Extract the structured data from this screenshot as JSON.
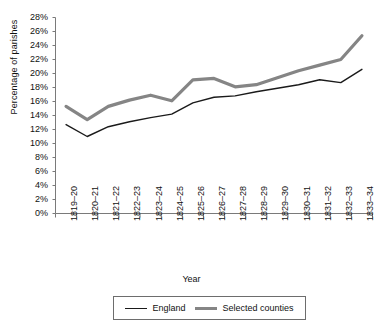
{
  "chart_data": {
    "type": "line",
    "title": "",
    "xlabel": "Year",
    "ylabel": "Percentage of parishes",
    "ylim": [
      0,
      28
    ],
    "ytick_labels": [
      "0%",
      "2%",
      "4%",
      "6%",
      "8%",
      "10%",
      "12%",
      "14%",
      "16%",
      "18%",
      "20%",
      "22%",
      "24%",
      "26%",
      "28%"
    ],
    "ytick_values": [
      0,
      2,
      4,
      6,
      8,
      10,
      12,
      14,
      16,
      18,
      20,
      22,
      24,
      26,
      28
    ],
    "grid": false,
    "legend_position": "bottom",
    "categories": [
      "1819–20",
      "1820–21",
      "1821–22",
      "1822–23",
      "1823–24",
      "1824–25",
      "1825–26",
      "1826–27",
      "1827–28",
      "1828–29",
      "1829–30",
      "1830–31",
      "1831–32",
      "1832–33",
      "1833–34"
    ],
    "series": [
      {
        "name": "England",
        "color": "#1a1a1a",
        "width": 1.4,
        "values": [
          12.7,
          11.0,
          12.4,
          13.1,
          13.7,
          14.2,
          15.8,
          16.6,
          16.8,
          17.4,
          17.9,
          18.4,
          19.1,
          18.7,
          20.6
        ]
      },
      {
        "name": "Selected counties",
        "color": "#858585",
        "width": 3.2,
        "values": [
          15.3,
          13.4,
          15.3,
          16.2,
          16.9,
          16.1,
          19.1,
          19.3,
          18.1,
          18.4,
          19.4,
          20.4,
          21.2,
          22.0,
          25.4
        ]
      }
    ]
  },
  "legend": {
    "entries": [
      {
        "label": "England"
      },
      {
        "label": "Selected counties"
      }
    ]
  },
  "axes": {
    "y_title": "Percentage of parishes",
    "x_title": "Year"
  }
}
